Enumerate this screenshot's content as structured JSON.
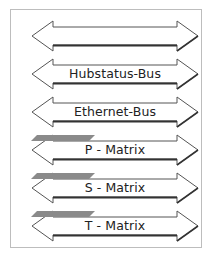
{
  "diagram": {
    "buses": [
      {
        "label": "",
        "highlight": false
      },
      {
        "label": "Hubstatus-Bus",
        "highlight": false
      },
      {
        "label": "Ethernet-Bus",
        "highlight": false
      },
      {
        "label": "P - Matrix",
        "highlight": true
      },
      {
        "label": "S - Matrix",
        "highlight": true
      },
      {
        "label": "T - Matrix",
        "highlight": true
      }
    ],
    "colors": {
      "outline": "#444444",
      "highlight": "#8a8a8a",
      "frame": "#bdbdbd"
    }
  }
}
